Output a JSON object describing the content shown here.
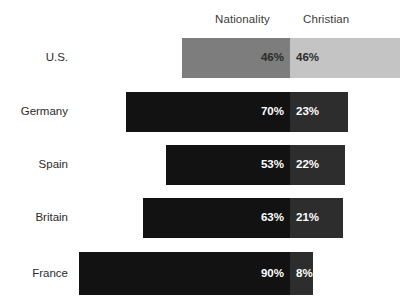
{
  "chart_data": {
    "type": "bar",
    "subtype": "stacked-horizontal",
    "title": "",
    "subtitle": "",
    "xlabel": "",
    "ylabel": "",
    "grid": false,
    "legend_position": "top-as-column-headers",
    "categories": [
      "U.S.",
      "Germany",
      "Spain",
      "Britain",
      "France"
    ],
    "series": [
      {
        "name": "Nationality",
        "values": [
          46,
          70,
          53,
          63,
          90
        ],
        "labels": [
          "46%",
          "70%",
          "53%",
          "63%",
          "90%"
        ]
      },
      {
        "name": "Christian",
        "values": [
          46,
          23,
          22,
          21,
          8
        ],
        "labels": [
          "46%",
          "23%",
          "22%",
          "21%",
          "8%"
        ]
      }
    ],
    "value_suffix": "%"
  },
  "headers": {
    "nationality": "Nationality",
    "christian": "Christian"
  },
  "rows": [
    {
      "label": "U.S.",
      "nationality_label": "46%",
      "christian_label": "46%",
      "nationality_color": "#7d7d7d",
      "christian_color": "#c4c4c4",
      "nationality_text_color": "#2b2b2b",
      "christian_text_color": "#2b2b2b"
    },
    {
      "label": "Germany",
      "nationality_label": "70%",
      "christian_label": "23%",
      "nationality_color": "#121212",
      "christian_color": "#2d2d2d",
      "nationality_text_color": "#ffffff",
      "christian_text_color": "#ffffff"
    },
    {
      "label": "Spain",
      "nationality_label": "53%",
      "christian_label": "22%",
      "nationality_color": "#121212",
      "christian_color": "#2d2d2d",
      "nationality_text_color": "#ffffff",
      "christian_text_color": "#ffffff"
    },
    {
      "label": "Britain",
      "nationality_label": "63%",
      "christian_label": "21%",
      "nationality_color": "#121212",
      "christian_color": "#2d2d2d",
      "nationality_text_color": "#ffffff",
      "christian_text_color": "#ffffff"
    },
    {
      "label": "France",
      "nationality_label": "90%",
      "christian_label": "8%",
      "nationality_color": "#121212",
      "christian_color": "#2d2d2d",
      "nationality_text_color": "#ffffff",
      "christian_text_color": "#ffffff"
    }
  ],
  "geometry": {
    "split_x": 290,
    "row_tops": [
      38,
      92,
      145,
      198,
      252
    ],
    "row_heights": [
      40,
      40,
      40,
      40,
      43
    ],
    "nationality_left": [
      182,
      126,
      166,
      143,
      79
    ],
    "christian_right": [
      400,
      348,
      345,
      343,
      313
    ]
  },
  "colors": {
    "background": "#ffffff",
    "label_text": "#2b2b2b",
    "header_text": "#3b3b3b"
  }
}
